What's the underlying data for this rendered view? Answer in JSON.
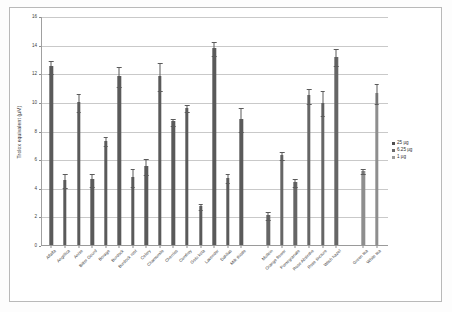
{
  "chart_data": {
    "type": "bar",
    "title": "",
    "xlabel": "",
    "ylabel": "Trolox equivalent (µM)",
    "ylim": [
      0,
      16
    ],
    "yticks": [
      0,
      2,
      4,
      6,
      8,
      10,
      12,
      14,
      16
    ],
    "grid": true,
    "legend_position": "right",
    "legend": [
      "25 µg",
      "6.25 µg",
      "1 µg"
    ],
    "categories": [
      "Alfalfa",
      "Angelica",
      "Anise",
      "Bitter Gourd",
      "Borage",
      "Burdock",
      "Burdock root",
      "Celery",
      "Chamomile",
      "Cherries",
      "Comfrey",
      "Gotu kola",
      "Lavender",
      "Dahlias",
      "Milk thistle",
      "Mullein",
      "Orange flower",
      "Pomegranate",
      "Rose Absinthe",
      "Rose tincture",
      "Witch hazel",
      "Green tea",
      "White tea"
    ],
    "values": [
      12.5,
      4.55,
      10.0,
      4.6,
      7.3,
      11.8,
      4.75,
      5.5,
      11.8,
      8.65,
      9.6,
      2.7,
      13.75,
      4.7,
      8.8,
      2.1,
      6.3,
      4.4,
      10.45,
      9.95,
      13.15,
      5.2,
      10.65
    ],
    "errors": [
      0.45,
      0.5,
      0.65,
      0.45,
      0.3,
      0.7,
      0.65,
      0.55,
      1.0,
      0.25,
      0.25,
      0.2,
      0.5,
      0.3,
      0.85,
      0.3,
      0.3,
      0.25,
      0.55,
      0.9,
      0.6,
      0.2,
      0.7
    ],
    "series_index": [
      0,
      0,
      0,
      0,
      0,
      0,
      0,
      0,
      0,
      0,
      0,
      0,
      0,
      0,
      0,
      1,
      1,
      1,
      1,
      1,
      1,
      2,
      2
    ],
    "group_breaks_after": [
      14,
      20
    ]
  }
}
